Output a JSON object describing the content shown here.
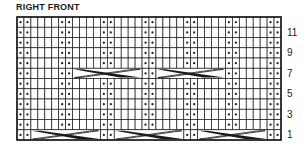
{
  "title": "RIGHT FRONT",
  "grid": {
    "columns": 38,
    "rows": 12,
    "x": 17,
    "y": 17,
    "width": 264,
    "height": 123,
    "purl_pattern_period": 6,
    "purl_columns_in_period": [
      0,
      1
    ],
    "cable_rows": [
      {
        "row": 1,
        "spans": [
          [
            2,
            11
          ],
          [
            14,
            23
          ],
          [
            26,
            35
          ]
        ]
      },
      {
        "row": 7,
        "spans": [
          [
            8,
            17
          ],
          [
            20,
            29
          ]
        ]
      }
    ]
  },
  "row_labels": [
    "1",
    "3",
    "5",
    "7",
    "9",
    "11"
  ],
  "legend_symbols": {
    "blank": "knit-stitch",
    "dot": "purl-stitch",
    "cable": "cable-cross"
  },
  "colors": {
    "line": "#1a1a1a",
    "background": "#ffffff"
  }
}
